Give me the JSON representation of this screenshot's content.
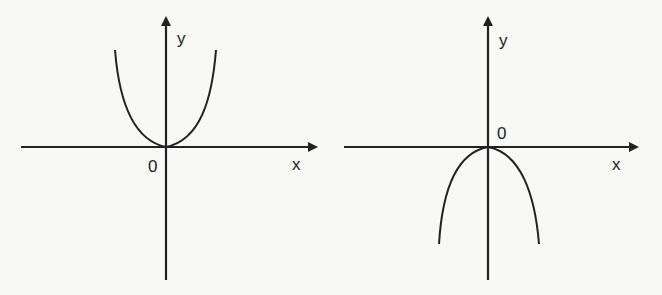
{
  "graphs": [
    {
      "id": "left",
      "description": "Upward-opening even power curve (like y = x^4) tangent to x-axis at origin",
      "labels": {
        "y_axis": "y",
        "x_axis": "x",
        "origin": "0"
      },
      "curve": "upward",
      "origin_label_position": "below-left"
    },
    {
      "id": "right",
      "description": "Downward-opening even power curve (like y = -x^4) tangent to x-axis at origin",
      "labels": {
        "y_axis": "y",
        "x_axis": "x",
        "origin": "0"
      },
      "curve": "downward",
      "origin_label_position": "above-right"
    }
  ],
  "colors": {
    "background": "#f8f8f7",
    "stroke": "#222222"
  }
}
